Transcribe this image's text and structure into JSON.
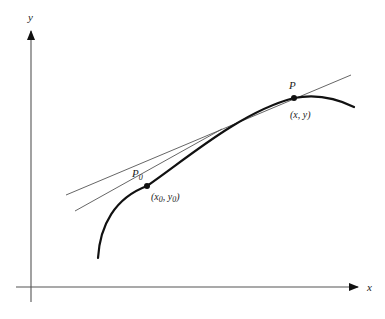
{
  "diagram": {
    "axes": {
      "x_label": "x",
      "y_label": "y"
    },
    "points": [
      {
        "id": "P0",
        "label_main": "P",
        "label_sub": "0",
        "coord_open": "(x",
        "coord_sub1": "0",
        "coord_mid": ", y",
        "coord_sub2": "0",
        "coord_close": ")"
      },
      {
        "id": "P",
        "label_main": "P",
        "coord_text": "(x, y)"
      }
    ],
    "lines": [
      {
        "id": "tangent",
        "description": "tangent line at P0"
      },
      {
        "id": "secant",
        "description": "secant line through P0 and P"
      }
    ],
    "colors": {
      "axis": "#555555",
      "curve": "#111111",
      "lines": "#555555",
      "text": "#222222"
    }
  }
}
